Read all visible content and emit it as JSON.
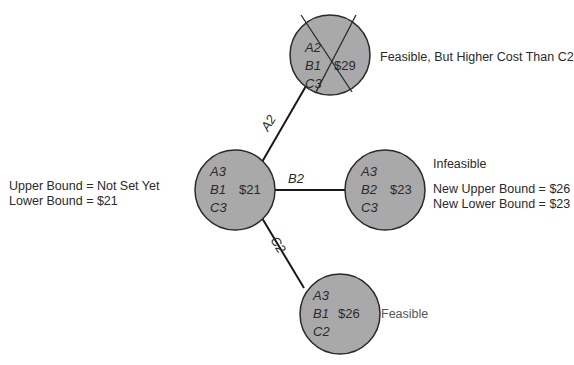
{
  "diagram": {
    "type": "branch-and-bound-tree",
    "colors": {
      "node_fill": "#a9a9a9",
      "node_stroke": "#2a2a2a",
      "edge": "#1a1a1a",
      "background": "#ffffff"
    },
    "nodes": {
      "root": {
        "lines": [
          "A3",
          "B1",
          "C3"
        ],
        "cost": "$21",
        "note": [
          "Upper Bound = Not Set Yet",
          "Lower Bound = $21"
        ]
      },
      "a2": {
        "lines": [
          "A2",
          "B1",
          "C3"
        ],
        "cost": "$29",
        "crossed_out": true,
        "note": [
          "Feasible, But Higher Cost Than C2"
        ]
      },
      "b2": {
        "lines": [
          "A3",
          "B2",
          "C3"
        ],
        "cost": "$23",
        "note_title": "Infeasible",
        "note": [
          "New Upper Bound = $26",
          "New Lower Bound = $23"
        ]
      },
      "c2": {
        "lines": [
          "A3",
          "B1",
          "C2"
        ],
        "cost": "$26",
        "note": [
          "Feasible"
        ]
      }
    },
    "edges": [
      {
        "from": "root",
        "to": "a2",
        "label": "A2"
      },
      {
        "from": "root",
        "to": "b2",
        "label": "B2"
      },
      {
        "from": "root",
        "to": "c2",
        "label": "C2"
      }
    ]
  }
}
